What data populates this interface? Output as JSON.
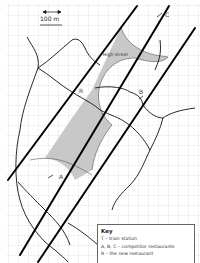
{
  "map": {
    "scale_bar": {
      "label": "100 m"
    },
    "street_label": "High street",
    "points": {
      "T": {
        "label": "T"
      },
      "A": {
        "label": "A"
      },
      "B": {
        "label": "B"
      },
      "C": {
        "label": "C"
      },
      "R": {
        "label": "R"
      }
    },
    "key": {
      "title": "Key",
      "items": [
        "T – train station",
        "A, B, C – competitor restaurants",
        "R – the new restaurant"
      ]
    },
    "colors": {
      "grid": "#d4d4d4",
      "road": "#111111",
      "rail": "#000000",
      "shaded_zone": "#c8c8c8"
    }
  }
}
